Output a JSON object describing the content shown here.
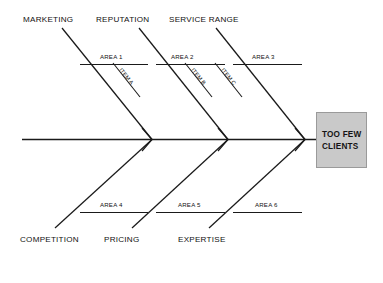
{
  "diagram": {
    "type": "fishbone-ishikawa",
    "effect": {
      "label_line1": "TOO FEW",
      "label_line2": "CLIENTS",
      "box_fill": "#c9c9c9",
      "box_stroke": "#9a9a9a"
    },
    "line_color": "#1a1a1a",
    "background": "#ffffff",
    "categories_top": [
      {
        "label": "MARKETING"
      },
      {
        "label": "REPUTATION"
      },
      {
        "label": "SERVICE RANGE"
      }
    ],
    "categories_bottom": [
      {
        "label": "COMPETITION"
      },
      {
        "label": "PRICING"
      },
      {
        "label": "EXPERTISE"
      }
    ],
    "areas_top": [
      {
        "label": "AREA 1"
      },
      {
        "label": "AREA 2"
      },
      {
        "label": "AREA 3"
      }
    ],
    "areas_bottom": [
      {
        "label": "AREA 4"
      },
      {
        "label": "AREA 5"
      },
      {
        "label": "AREA 6"
      }
    ],
    "items": [
      {
        "label": "ITEM A"
      },
      {
        "label": "ITEM B"
      },
      {
        "label": "ITEM C"
      }
    ]
  }
}
